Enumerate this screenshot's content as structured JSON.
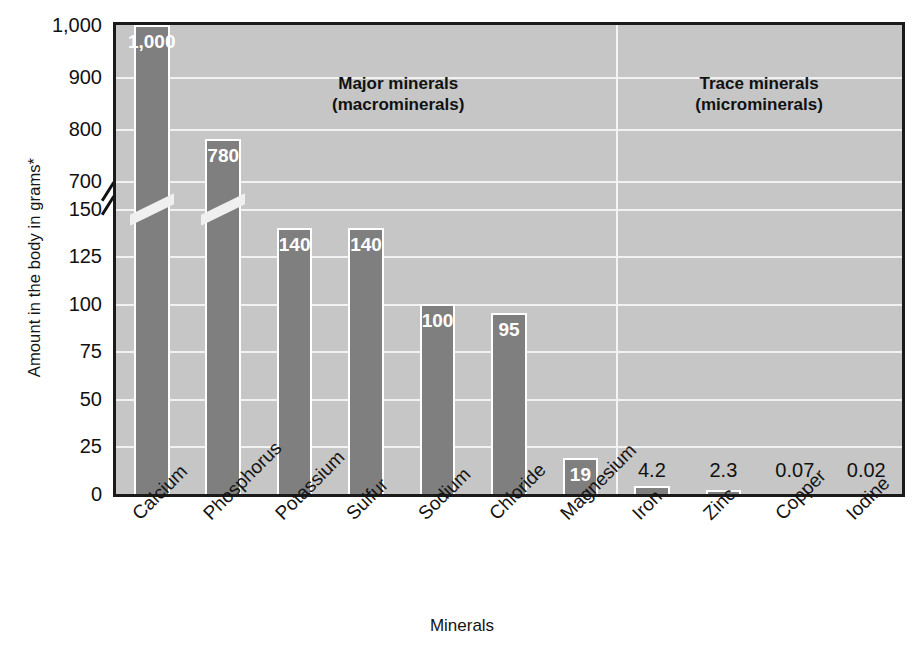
{
  "chart_data": {
    "type": "bar",
    "title": "",
    "xlabel": "Minerals",
    "ylabel": "Amount in the body in grams*",
    "categories": [
      "Calcium",
      "Phosphorus",
      "Potassium",
      "Sulfur",
      "Sodium",
      "Chloride",
      "Magnesium",
      "Iron",
      "Zinc",
      "Copper",
      "Iodine"
    ],
    "values": [
      1000,
      780,
      140,
      140,
      100,
      95,
      19,
      4.2,
      2.3,
      0.07,
      0.02
    ],
    "value_labels": [
      "1,000",
      "780",
      "140",
      "140",
      "100",
      "95",
      "19",
      "4.2",
      "2.3",
      "0.07",
      "0.02"
    ],
    "ytick_labels": [
      "1,000",
      "900",
      "800",
      "700",
      "150",
      "125",
      "100",
      "75",
      "50",
      "25",
      "0"
    ],
    "ytick_values": [
      1000,
      900,
      800,
      700,
      150,
      125,
      100,
      75,
      50,
      25,
      0
    ],
    "axis_break": {
      "between": [
        700,
        150
      ],
      "present": true
    },
    "ylim": [
      0,
      1000
    ],
    "grid": true,
    "legend": "none",
    "annotations": [
      {
        "text": "Major minerals\n(macrominerals)",
        "covers": [
          "Calcium",
          "Phosphorus",
          "Potassium",
          "Sulfur",
          "Sodium",
          "Chloride",
          "Magnesium"
        ]
      },
      {
        "text": "Trace minerals\n(microminerals)",
        "covers": [
          "Iron",
          "Zinc",
          "Copper",
          "Iodine"
        ]
      }
    ],
    "colors": {
      "bar": "#7f7f7f",
      "plot_background": "#c6c6c6",
      "gridline": "#f2f2f2",
      "frame": "#1a1a1a",
      "label_light": "#ffffff",
      "label_dark": "#111111"
    }
  },
  "axis": {
    "y_title": "Amount in the body in grams*",
    "x_title": "Minerals"
  },
  "annotations": {
    "major": {
      "line1": "Major minerals",
      "line2": "(macrominerals)"
    },
    "trace": {
      "line1": "Trace minerals",
      "line2": "(microminerals)"
    }
  }
}
